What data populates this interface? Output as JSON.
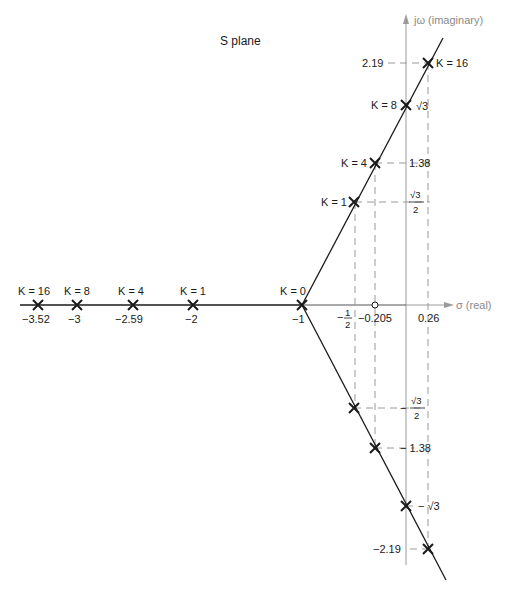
{
  "title": "S plane",
  "axes": {
    "imaginary_label": "jω (imaginary)",
    "real_label": "σ (real)",
    "color": "#9a9a9a"
  },
  "colors": {
    "locus": "#1a1a1a",
    "dashed": "#9a9a9a",
    "axis": "#9a9a9a"
  },
  "real_axis_points": [
    {
      "k_label": "K = 16",
      "value_label": "−3.52",
      "x": 38
    },
    {
      "k_label": "K = 8",
      "value_label": "−3",
      "x": 77
    },
    {
      "k_label": "K = 4",
      "value_label": "−2.59",
      "x": 133
    },
    {
      "k_label": "K = 1",
      "value_label": "−2",
      "x": 193
    },
    {
      "k_label": "K = 0",
      "value_label": "−1",
      "x": 302
    }
  ],
  "real_axis_marks": {
    "half": {
      "num": "1",
      "den": "2",
      "sign": "−"
    },
    "centroid": "−0.205",
    "crossing": "0.26"
  },
  "upper_branch": [
    {
      "k_label": "K = 16",
      "imag_label": "2.19"
    },
    {
      "k_label": "K = 8",
      "imag_label": "√3"
    },
    {
      "k_label": "K = 4",
      "imag_label": "1.38"
    },
    {
      "k_label": "K = 1",
      "imag_num": "√3",
      "imag_den": "2"
    }
  ],
  "lower_branch": [
    {
      "imag_sign": "−",
      "imag_num": "√3",
      "imag_den": "2"
    },
    {
      "imag_label": "− 1.38"
    },
    {
      "imag_label": "− √3"
    },
    {
      "imag_label": "−2.19"
    }
  ]
}
